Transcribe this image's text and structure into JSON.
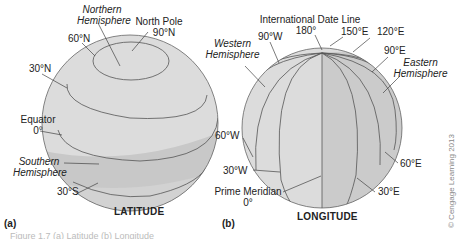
{
  "figure": {
    "panel_a": {
      "label": "(a)",
      "title": "LATITUDE",
      "labels": {
        "northern_hemisphere_line1": "Northern",
        "northern_hemisphere_line2": "Hemisphere",
        "north_pole": "North Pole",
        "north_pole_deg": "90°N",
        "lat_60n": "60°N",
        "lat_30n": "30°N",
        "equator": "Equator",
        "equator_deg": "0°",
        "southern_hemisphere_line1": "Southern",
        "southern_hemisphere_line2": "Hemisphere",
        "lat_30s": "30°S"
      }
    },
    "panel_b": {
      "label": "(b)",
      "title": "LONGITUDE",
      "labels": {
        "idl": "International Date Line",
        "idl_deg": "180°",
        "lon_150e": "150°E",
        "lon_120e": "120°E",
        "lon_90e": "90°E",
        "lon_90w": "90°W",
        "western_hemisphere_line1": "Western",
        "western_hemisphere_line2": "Hemisphere",
        "eastern_hemisphere_line1": "Eastern",
        "eastern_hemisphere_line2": "Hemisphere",
        "lon_60w": "60°W",
        "lon_30w": "30°W",
        "prime_meridian": "Prime Meridian",
        "prime_meridian_deg": "0°",
        "lon_60e": "60°E",
        "lon_30e": "30°E"
      }
    },
    "copyright": "© Cengage Learning 2013",
    "caption": "Figure 1.7 (a) Latitude (b) Longitude",
    "colors": {
      "globe_light": "#dcdcdc",
      "globe_dark": "#c4c4c4",
      "line": "#555555"
    }
  }
}
